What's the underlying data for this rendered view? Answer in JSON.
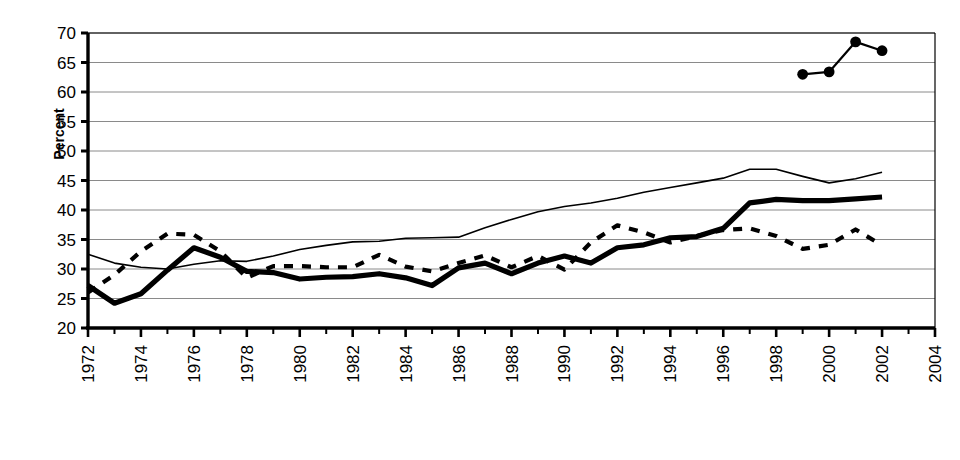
{
  "page": {
    "background": "#ffffff",
    "ink": "#000000",
    "grid_color": "#8a8a8a"
  },
  "axis_label": {
    "y": "Percent"
  },
  "legend": {
    "position": "bottom",
    "entries": [
      {
        "label": "WHITE",
        "style": "thin-solid-line",
        "color": "#000000"
      },
      {
        "label": "BLACK",
        "style": "thick-solid-line",
        "color": "#000000"
      },
      {
        "label": "ASIAN & PACIFIC ISLANDER",
        "style": "line-with-round-markers",
        "color": "#000000"
      },
      {
        "label": "HISPANIC (OF ANY RACE)",
        "style": "dashed-line",
        "color": "#000000"
      }
    ]
  },
  "chart_data": {
    "type": "line",
    "title": "",
    "subtitle": "",
    "xlabel": "",
    "ylabel": "Percent",
    "xlim": [
      1972,
      2004
    ],
    "ylim": [
      20,
      70
    ],
    "ytick_step": 5,
    "yticks": [
      20,
      25,
      30,
      35,
      40,
      45,
      50,
      55,
      60,
      65,
      70
    ],
    "xticks_major": [
      1972,
      1974,
      1976,
      1978,
      1980,
      1982,
      1984,
      1986,
      1988,
      1990,
      1992,
      1994,
      1996,
      1998,
      2000,
      2002,
      2004
    ],
    "xticks_minor_step": 1,
    "xtick_label_rotation": -90,
    "grid": "horizontal-only",
    "legend_position": "bottom",
    "series": [
      {
        "name": "WHITE",
        "style": "thin-solid-line",
        "x": [
          1972,
          1973,
          1974,
          1975,
          1976,
          1977,
          1978,
          1979,
          1980,
          1981,
          1982,
          1983,
          1984,
          1985,
          1986,
          1987,
          1988,
          1989,
          1990,
          1991,
          1992,
          1993,
          1994,
          1995,
          1996,
          1997,
          1998,
          1999,
          2000,
          2001,
          2002
        ],
        "values": [
          32.5,
          31.0,
          30.3,
          30.0,
          30.8,
          31.4,
          31.3,
          32.2,
          33.3,
          34.0,
          34.6,
          34.7,
          35.2,
          35.3,
          35.4,
          37.0,
          38.4,
          39.7,
          40.6,
          41.2,
          42.0,
          43.0,
          43.8,
          44.6,
          45.4,
          46.9,
          46.9,
          45.7,
          44.6,
          45.3,
          46.4
        ]
      },
      {
        "name": "BLACK",
        "style": "thick-solid-line",
        "x": [
          1972,
          1973,
          1974,
          1975,
          1976,
          1977,
          1978,
          1979,
          1980,
          1981,
          1982,
          1983,
          1984,
          1985,
          1986,
          1987,
          1988,
          1989,
          1990,
          1991,
          1992,
          1993,
          1994,
          1995,
          1996,
          1997,
          1998,
          1999,
          2000,
          2001,
          2002
        ],
        "values": [
          27.2,
          24.2,
          25.8,
          29.8,
          33.6,
          32.0,
          29.6,
          29.4,
          28.3,
          28.6,
          28.7,
          29.2,
          28.5,
          27.2,
          30.2,
          31.0,
          29.2,
          31.0,
          32.2,
          31.0,
          33.6,
          34.1,
          35.3,
          35.5,
          36.9,
          41.2,
          41.8,
          41.6,
          41.6,
          41.9,
          42.2
        ]
      },
      {
        "name": "ASIAN & PACIFIC ISLANDER",
        "style": "line-with-round-markers",
        "x": [
          1999,
          2000,
          2001,
          2002
        ],
        "values": [
          63.0,
          63.4,
          68.5,
          67.0
        ]
      },
      {
        "name": "HISPANIC (OF ANY RACE)",
        "style": "dashed-line",
        "x": [
          1972,
          1973,
          1974,
          1975,
          1976,
          1977,
          1978,
          1979,
          1980,
          1981,
          1982,
          1983,
          1984,
          1985,
          1986,
          1987,
          1988,
          1989,
          1990,
          1991,
          1992,
          1993,
          1994,
          1995,
          1996,
          1997,
          1998,
          1999,
          2000,
          2001,
          2002
        ],
        "values": [
          26.0,
          29.0,
          33.0,
          36.0,
          35.8,
          33.0,
          28.5,
          30.5,
          30.5,
          30.3,
          30.3,
          32.4,
          30.4,
          29.6,
          31.0,
          32.3,
          30.3,
          32.2,
          29.9,
          34.5,
          37.4,
          36.2,
          34.5,
          35.6,
          36.6,
          36.9,
          35.6,
          33.4,
          34.1,
          36.7,
          34.0
        ]
      }
    ]
  }
}
